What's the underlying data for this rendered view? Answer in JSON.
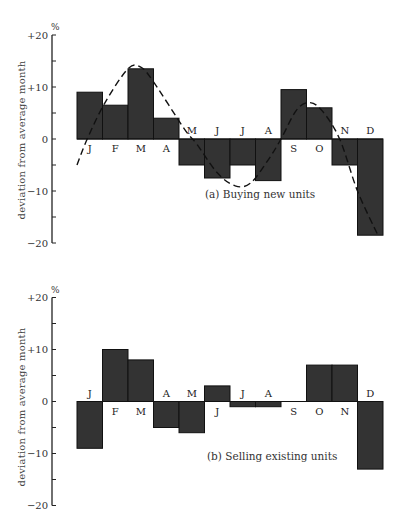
{
  "chart_data": [
    {
      "type": "bar",
      "title": "(a)  Buying new units",
      "caption": "(a)  Buying new units",
      "xlabel": "",
      "ylabel": "deviation from average month",
      "yunit": "%",
      "ylim": [
        -20,
        20
      ],
      "yticks": [
        20,
        15,
        10,
        5,
        0,
        -5,
        -10,
        -15,
        -20
      ],
      "ytick_labels": [
        {
          "value": 20,
          "label": "+20"
        },
        {
          "value": 10,
          "label": "+10"
        },
        {
          "value": 0,
          "label": "0"
        },
        {
          "value": -10,
          "label": "−10"
        },
        {
          "value": -20,
          "label": "−20"
        }
      ],
      "categories": [
        "J",
        "F",
        "M",
        "A",
        "M",
        "J",
        "J",
        "A",
        "S",
        "O",
        "N",
        "D"
      ],
      "values": [
        9,
        6.5,
        13.5,
        4,
        -5,
        -7.5,
        -5,
        -8,
        9.5,
        6,
        -5,
        -18.5
      ],
      "trend_curve": {
        "style": "dashed",
        "points": [
          {
            "x": 0.0,
            "y": -5
          },
          {
            "x": 0.4,
            "y": 0
          },
          {
            "x": 1.1,
            "y": 7
          },
          {
            "x": 2.0,
            "y": 13.5
          },
          {
            "x": 2.5,
            "y": 13.8
          },
          {
            "x": 3.0,
            "y": 11
          },
          {
            "x": 4.2,
            "y": 2
          },
          {
            "x": 4.7,
            "y": -1
          },
          {
            "x": 5.5,
            "y": -6.5
          },
          {
            "x": 6.2,
            "y": -9
          },
          {
            "x": 6.8,
            "y": -8.5
          },
          {
            "x": 7.5,
            "y": -4
          },
          {
            "x": 8.0,
            "y": 0
          },
          {
            "x": 8.6,
            "y": 5.5
          },
          {
            "x": 9.1,
            "y": 7
          },
          {
            "x": 9.6,
            "y": 5.5
          },
          {
            "x": 10.3,
            "y": 0
          },
          {
            "x": 11.0,
            "y": -10
          },
          {
            "x": 11.8,
            "y": -18.5
          }
        ]
      },
      "grid": false,
      "legend": null
    },
    {
      "type": "bar",
      "title": "(b)  Selling existing units",
      "caption": "(b)  Selling existing units",
      "xlabel": "",
      "ylabel": "deviation from average month",
      "yunit": "%",
      "ylim": [
        -20,
        20
      ],
      "yticks": [
        20,
        15,
        10,
        5,
        0,
        -5,
        -10,
        -15,
        -20
      ],
      "ytick_labels": [
        {
          "value": 20,
          "label": "+20"
        },
        {
          "value": 10,
          "label": "+10"
        },
        {
          "value": 0,
          "label": "0"
        },
        {
          "value": -10,
          "label": "−10"
        },
        {
          "value": -20,
          "label": "−20"
        }
      ],
      "categories": [
        "J",
        "F",
        "M",
        "A",
        "M",
        "J",
        "J",
        "A",
        "S",
        "O",
        "N",
        "D"
      ],
      "values": [
        -9,
        10,
        8,
        -5,
        -6,
        3,
        -1,
        -1,
        0,
        7,
        7,
        -13
      ],
      "grid": false,
      "legend": null
    }
  ],
  "style": {
    "bar_fill": "#333333",
    "bar_stroke": "#111111",
    "axis_color": "#222222"
  }
}
